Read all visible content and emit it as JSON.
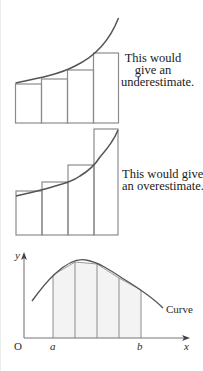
{
  "figure_1": {
    "caption_lines": [
      "This would",
      "give an",
      "underestimate."
    ],
    "method": "left-endpoint rectangles",
    "strips": 4
  },
  "figure_2": {
    "caption_lines": [
      "This would give",
      "an overestimate."
    ],
    "method": "right-endpoint rectangles",
    "strips": 4
  },
  "figure_3": {
    "axis_y_label": "y",
    "axis_x_label": "x",
    "origin_label": "O",
    "lower_limit_label": "a",
    "upper_limit_label": "b",
    "curve_label": "Curve",
    "method": "trapezium strips",
    "strips": 4
  },
  "colors": {
    "curve": "#555555",
    "rect_stroke": "#8a8a8a",
    "strip_fill": "#f3f3f3",
    "axis": "#777777"
  }
}
